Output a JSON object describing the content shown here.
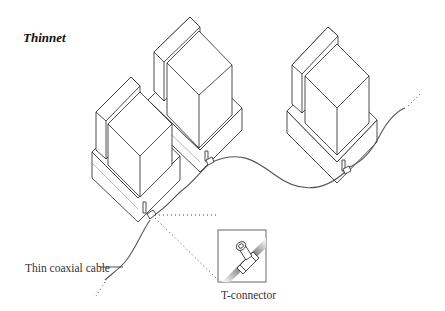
{
  "title": "Thinnet",
  "labels": {
    "cable": "Thin coaxial cable",
    "connector": "T-connector"
  },
  "diagram": {
    "computers": [
      {
        "name": "computer-left",
        "position": "front-left"
      },
      {
        "name": "computer-middle",
        "position": "back-middle"
      },
      {
        "name": "computer-right",
        "position": "back-right"
      }
    ],
    "inset": "T-connector detail",
    "colors": {
      "line": "#222222",
      "cable": "#555555",
      "background": "#ffffff"
    }
  }
}
